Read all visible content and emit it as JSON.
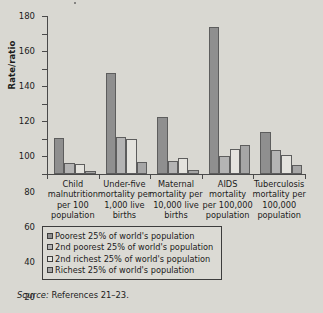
{
  "chart_data": {
    "type": "bar",
    "title": "",
    "xlabel": "",
    "ylabel": "Rate/ratio",
    "ylim": [
      0,
      180
    ],
    "yticks": [
      0,
      20,
      40,
      60,
      80,
      100,
      120,
      140,
      160,
      180
    ],
    "grid": false,
    "legend_position": "below-axes",
    "categories": [
      "Child\nmalnutrition\nper 100\npopulation",
      "Under-five\nmortality per\n1,000 live\nbirths",
      "Maternal\nmortality per\n10,000 live\nbirths",
      "AIDS\nmortality\nper 100,000\npopulation",
      "Tuberculosis\nmortality per\n100,000\npopulation"
    ],
    "series": [
      {
        "name": "Poorest 25% of world's population",
        "color": "#8f8f8f",
        "values": [
          41,
          115,
          65,
          167,
          48
        ]
      },
      {
        "name": "2nd poorest 25% of world's population",
        "color": "#b4b4b4",
        "values": [
          13,
          42,
          15,
          20,
          27
        ]
      },
      {
        "name": "2nd richest 25% of world's population",
        "color": "#e4e3de",
        "values": [
          11,
          40,
          18,
          29,
          22
        ]
      },
      {
        "name": "Richest 25% of world's population",
        "color": "#a6a6a6",
        "values": [
          4,
          14,
          5,
          33,
          10
        ]
      }
    ]
  },
  "legend": {
    "items": [
      "Poorest 25% of world's population",
      "2nd poorest 25% of world's population",
      "2nd richest 25% of world's population",
      "Richest 25% of world's population"
    ]
  },
  "source": {
    "label": "Source:",
    "text": "References 21–23."
  }
}
